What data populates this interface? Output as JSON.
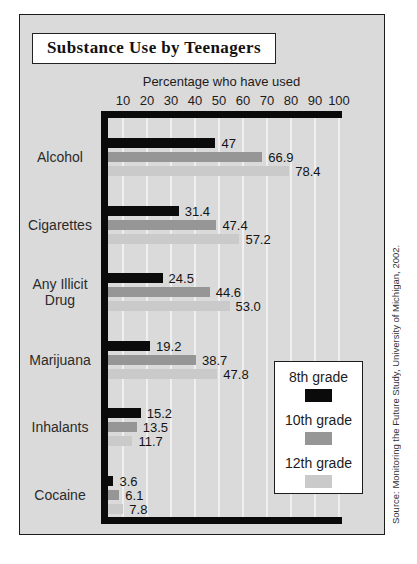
{
  "title": "Substance Use by Teenagers",
  "source_note": "Source: Monitoring the Future Study, University of Michigan, 2002.",
  "colors": {
    "figure_background": "#dadada",
    "axis_frame": "#0a0a0a",
    "gridline": "#efefef",
    "series_8th": "#0b0b0b",
    "series_10th": "#969696",
    "series_12th": "#cacaca"
  },
  "chart_data": {
    "type": "bar",
    "orientation": "horizontal",
    "title": "Substance Use by Teenagers",
    "axis_title": "Percentage who have used",
    "xlabel": "Percentage who have used",
    "ylabel": "",
    "xlim": [
      0,
      100
    ],
    "x_ticks": [
      "10",
      "20",
      "30",
      "40",
      "50",
      "60",
      "70",
      "80",
      "90",
      "100"
    ],
    "grid": true,
    "legend_position": "bottom-right",
    "categories": [
      "Alcohol",
      "Cigarettes",
      "Any Illicit Drug",
      "Marijuana",
      "Inhalants",
      "Cocaine"
    ],
    "series": [
      {
        "name": "8th grade",
        "color": "#0b0b0b",
        "values": [
          47,
          31.4,
          24.5,
          19.2,
          15.2,
          3.6
        ],
        "labels": [
          "47",
          "31.4",
          "24.5",
          "19.2",
          "15.2",
          "3.6"
        ]
      },
      {
        "name": "10th grade",
        "color": "#969696",
        "values": [
          66.9,
          47.4,
          44.6,
          38.7,
          13.5,
          6.1
        ],
        "labels": [
          "66.9",
          "47.4",
          "44.6",
          "38.7",
          "13.5",
          "6.1"
        ]
      },
      {
        "name": "12th grade",
        "color": "#cacaca",
        "values": [
          78.4,
          57.2,
          53.0,
          47.8,
          11.7,
          7.8
        ],
        "labels": [
          "78.4",
          "57.2",
          "53.0",
          "47.8",
          "11.7",
          "7.8"
        ]
      }
    ]
  }
}
